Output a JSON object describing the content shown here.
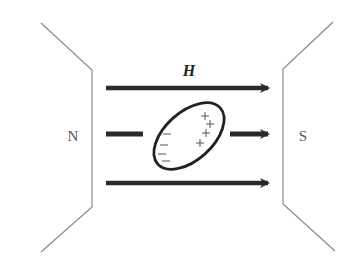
{
  "diagram": {
    "field_label": "H",
    "north_pole_label": "N",
    "south_pole_label": "S",
    "negative_charges": [
      "−",
      "−",
      "−",
      "−"
    ],
    "positive_charges": [
      "+",
      "+",
      "+",
      "+"
    ],
    "colors": {
      "pole_outline": "#8a8a8a",
      "arrow": "#2a2a2a",
      "ellipse": "#222222",
      "label": "#555555"
    }
  }
}
